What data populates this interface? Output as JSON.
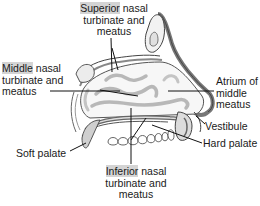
{
  "diagram": {
    "type": "anatomical-cross-section",
    "highlight_color": "#d4d4d4",
    "labels": {
      "superior": {
        "highlight": "Superior",
        "line1_rest": " nasal",
        "line2": "turbinate and",
        "line3": "meatus"
      },
      "middle": {
        "highlight": "Middle",
        "line1_rest": " nasal",
        "line2": "turbinate and",
        "line3": "meatus"
      },
      "inferior": {
        "highlight": "Inferior",
        "line1_rest": " nasal",
        "line2": "turbinate and",
        "line3": "meatus"
      },
      "atrium": {
        "line1": "Atrium of",
        "line2": "middle",
        "line3": "meatus"
      },
      "vestibule": "Vestibule",
      "hard_palate": "Hard palate",
      "soft_palate": "Soft palate"
    }
  }
}
